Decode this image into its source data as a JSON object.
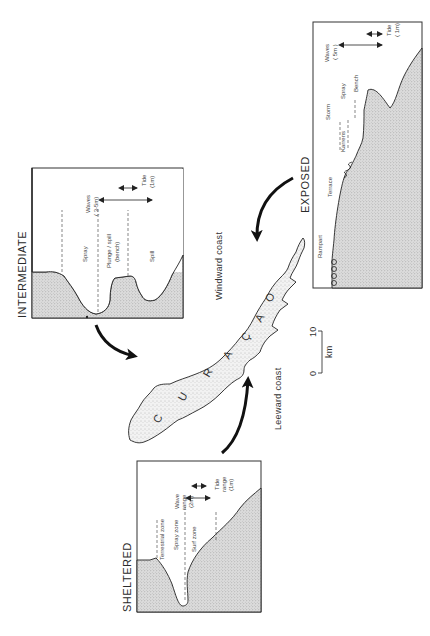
{
  "figure": {
    "island_name": "CURAÇAO",
    "island_letters": [
      "C",
      "U",
      "R",
      "A",
      "Ç",
      "A",
      "O"
    ],
    "windward_label": "Windward coast",
    "leeward_label": "Leeward coast",
    "scale": {
      "start": "0",
      "end": "10",
      "unit": "km"
    }
  },
  "panels": {
    "intermediate": {
      "title": "INTERMEDIATE",
      "zones": [
        "Spray",
        "Plunge / spill",
        "(bench)",
        "Spill"
      ],
      "waves_label": "Waves",
      "waves_value": "( 3-5m)",
      "tide_label": "Tide",
      "tide_value": "(1m)"
    },
    "exposed": {
      "title": "EXPOSED",
      "features": [
        "Rampart",
        "Terrace",
        "Storm",
        "Karrens",
        "Spray",
        "Bench"
      ],
      "waves_label": "Waves",
      "waves_value": "( 5m )",
      "tide_label": "Tide",
      "tide_value": "( 1m)"
    },
    "sheltered": {
      "title": "SHELTERED",
      "zones": [
        "Terrestrial  zone",
        "Spray  zone",
        "Surf  zone"
      ],
      "wave_label": "Wave",
      "wave_range_label": "range",
      "wave_value": "(2m)",
      "tide_label": "Tide",
      "tide_range_label": "range",
      "tide_value": "(1m)"
    }
  },
  "colors": {
    "ink": "#222222",
    "stipple_bg": "#d6d6d6",
    "paper": "#ffffff"
  }
}
